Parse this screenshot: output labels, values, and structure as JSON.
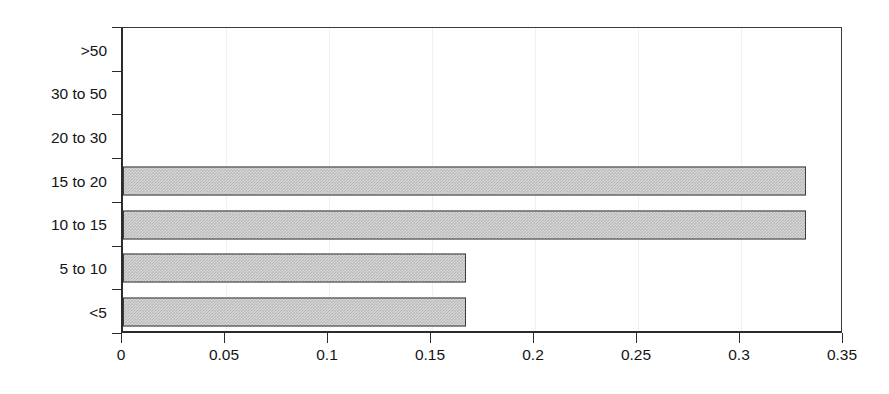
{
  "chart_data": {
    "type": "bar",
    "orientation": "horizontal",
    "title": "",
    "xlabel": "",
    "ylabel": "",
    "categories": [
      "<5",
      "5 to 10",
      "10 to 15",
      "15 to 20",
      "20 to 30",
      "30 to 50",
      ">50"
    ],
    "values": [
      0.167,
      0.167,
      0.333,
      0.333,
      0,
      0,
      0
    ],
    "xlim": [
      0,
      0.35
    ],
    "xticks": [
      0,
      0.05,
      0.1,
      0.15,
      0.2,
      0.25,
      0.3,
      0.35
    ],
    "xticklabels": [
      "0",
      "0.05",
      "0.1",
      "0.15",
      "0.2",
      "0.25",
      "0.3",
      "0.35"
    ],
    "grid": "vertical-faint",
    "legend": null,
    "series": [
      {
        "name": "",
        "values": [
          0.167,
          0.167,
          0.333,
          0.333,
          0,
          0,
          0
        ]
      }
    ],
    "bar_fill_color": "#b9b9b9",
    "bar_border_color": "#3d3d3d",
    "axis_color": "#2b2b2b",
    "plot_background": "#ffffff"
  },
  "axis": {
    "y_categories_top_to_bottom": [
      ">50",
      "30 to 50",
      "20 to 30",
      "15 to 20",
      "10 to 15",
      "5 to 10",
      "<5"
    ],
    "x_tick_labels": [
      "0",
      "0.05",
      "0.1",
      "0.15",
      "0.2",
      "0.25",
      "0.3",
      "0.35"
    ]
  }
}
